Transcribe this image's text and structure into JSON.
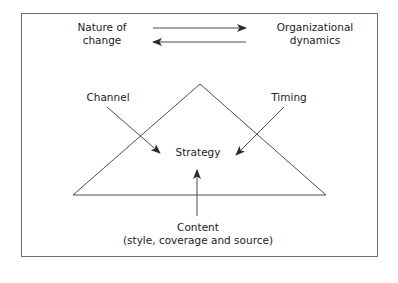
{
  "diagram": {
    "labels": {
      "nature_of_change_line1": "Nature of",
      "nature_of_change_line2": "change",
      "organizational_dynamics_line1": "Organizational",
      "organizational_dynamics_line2": "dynamics",
      "channel": "Channel",
      "timing": "Timing",
      "strategy": "Strategy",
      "content_line1": "Content",
      "content_line2": "(style, coverage and source)"
    },
    "colors": {
      "line": "#3a3a3a",
      "border": "#6e6e6e",
      "text": "#222222"
    }
  }
}
